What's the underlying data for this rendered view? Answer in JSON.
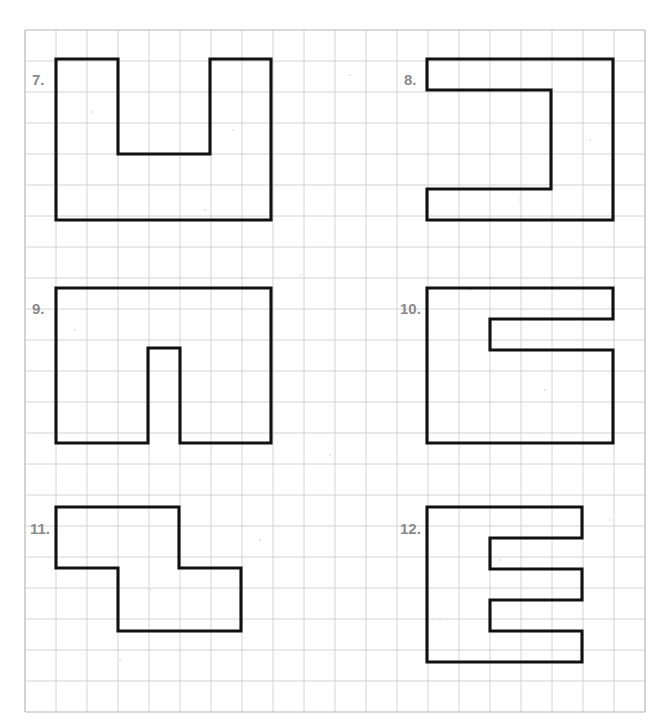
{
  "page": {
    "background_color": "#ffffff",
    "width": 672,
    "height": 724
  },
  "grid": {
    "name": "square-dot-grid",
    "origin_x": 25,
    "origin_y": 30,
    "cell_size": 31,
    "columns": 20,
    "rows": 22,
    "line_color": "#c9c9c9",
    "border_color": "#b5b5b5"
  },
  "figure_style": {
    "stroke_color": "#111111",
    "stroke_width": 3.1,
    "fill": "none",
    "label_color": "#8a8a8a"
  },
  "problems": [
    {
      "number": "7.",
      "name": "figure-7",
      "shape": "u-shape",
      "label_x": 32,
      "label_y": 72,
      "points": "56,59 118,59 118,154 210,154 210,59 271,59 271,220 56,220",
      "closed": true,
      "cells": 20,
      "perimeter_units": 26
    },
    {
      "number": "8.",
      "name": "figure-8",
      "shape": "c-bracket-shape",
      "label_x": 404,
      "label_y": 72,
      "points": "427,59 613,59 613,220 427,220 427,189 551,189 551,90 427,90",
      "closed": true,
      "cells": 18,
      "perimeter_units": 26
    },
    {
      "number": "9.",
      "name": "figure-9",
      "shape": "rectangle-with-bottom-notch",
      "label_x": 32,
      "label_y": 301,
      "points": "56,288 271,288 271,443 180,443 180,348 148,348 148,443 56,443",
      "closed": true,
      "cells": 30,
      "perimeter_units": 30
    },
    {
      "number": "10.",
      "name": "figure-10",
      "shape": "g-shape",
      "label_x": 400,
      "label_y": 301,
      "points": "427,288 613,288 613,319 490,319 490,350 613,350 613,443 427,443",
      "closed": true,
      "cells": 24,
      "perimeter_units": 28
    },
    {
      "number": "11.",
      "name": "figure-11",
      "shape": "z-step-shape",
      "label_x": 30,
      "label_y": 521,
      "points": "56,507 179,507 179,568 241,568 241,631 118,631 118,568 56,568",
      "closed": true,
      "cells": 12,
      "perimeter_units": 20
    },
    {
      "number": "12.",
      "name": "figure-12",
      "shape": "e-shape",
      "label_x": 400,
      "label_y": 521,
      "points": "427,507 582,507 582,538 490,538 490,569 582,569 582,600 490,600 490,631 582,631 582,662 427,662",
      "closed": true,
      "cells": 25,
      "perimeter_units": 34
    }
  ]
}
